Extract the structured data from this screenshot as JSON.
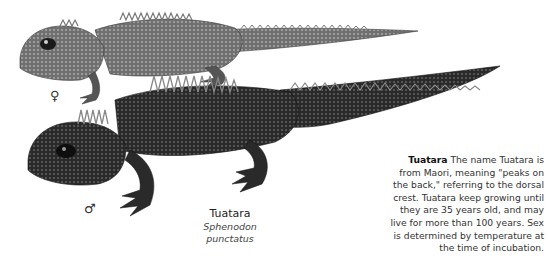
{
  "illustration": {
    "subject": "Two tuatara lizards, female (upper) and male (lower)",
    "female_symbol": "♀",
    "male_symbol": "♂",
    "colors": {
      "female_body": "#6a6a6a",
      "male_body": "#2e2e2e",
      "background": "#ffffff"
    }
  },
  "caption": {
    "common_name": "Tuatara",
    "scientific_name": "Sphenodon punctatus"
  },
  "description": {
    "title": "Tuatara",
    "text": "The name Tuatara is from Maori, meaning \"peaks on the back,\" referring to the dorsal crest. Tuatara keep growing until they are 35 years old, and may live for more than 100 years. Sex is determined by temperature at the time of incubation."
  }
}
